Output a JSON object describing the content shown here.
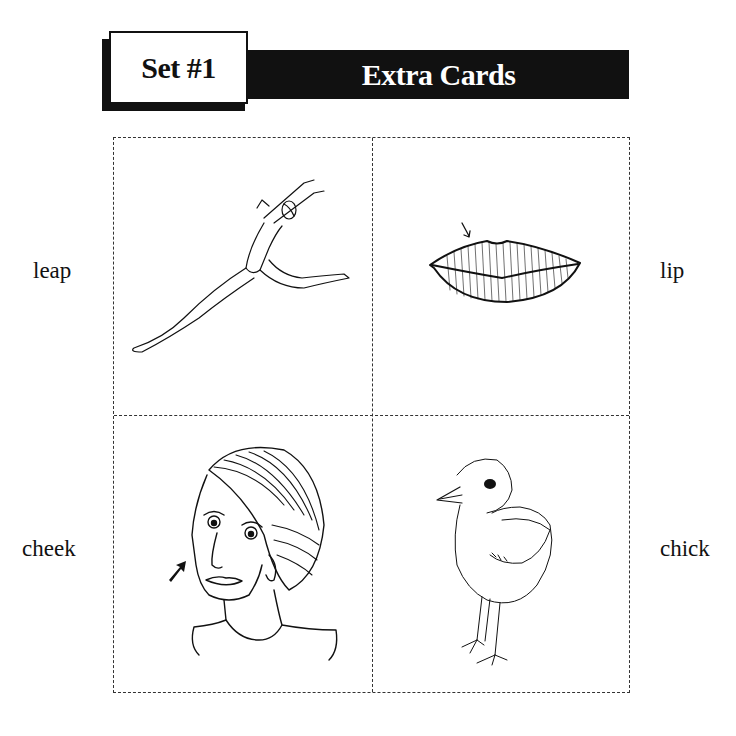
{
  "header": {
    "set_label": "Set #1",
    "title": "Extra Cards"
  },
  "cards": [
    {
      "word": "leap",
      "image": "dancer-leaping-illustration"
    },
    {
      "word": "lip",
      "image": "lips-with-arrow-illustration"
    },
    {
      "word": "cheek",
      "image": "woman-face-with-arrow-at-cheek-illustration"
    },
    {
      "word": "chick",
      "image": "baby-chick-illustration"
    }
  ],
  "colors": {
    "ink": "#111111",
    "paper": "#ffffff"
  }
}
